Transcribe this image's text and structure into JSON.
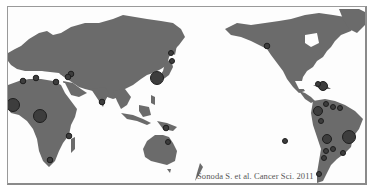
{
  "map": {
    "projection": "pacific-centered world map",
    "land_color": "#6b6b6b",
    "marker_color": "#3a3a3a",
    "marker_outline": "#1e1e1e",
    "background": "#ffffff",
    "markers": [
      {
        "region": "Morocco",
        "x": 40,
        "y": 76,
        "size": "small"
      },
      {
        "region": "Algeria",
        "x": 29,
        "y": 75,
        "size": "small"
      },
      {
        "region": "Tunisia/Libya",
        "x": 49,
        "y": 80,
        "size": "small"
      },
      {
        "region": "Middle East 1",
        "x": 64,
        "y": 72,
        "size": "small"
      },
      {
        "region": "Middle East 2",
        "x": 61,
        "y": 76,
        "size": "small"
      },
      {
        "region": "West Africa",
        "x": 12,
        "y": 104,
        "size": "large"
      },
      {
        "region": "Central Africa",
        "x": 39,
        "y": 115,
        "size": "large"
      },
      {
        "region": "East Africa",
        "x": 67,
        "y": 135,
        "size": "small"
      },
      {
        "region": "South Africa",
        "x": 49,
        "y": 159,
        "size": "small"
      },
      {
        "region": "India",
        "x": 101,
        "y": 101,
        "size": "small"
      },
      {
        "region": "Japan",
        "x": 156,
        "y": 77,
        "size": "large"
      },
      {
        "region": "Sakhalin/Hokkaido 1",
        "x": 170,
        "y": 52,
        "size": "small"
      },
      {
        "region": "Hokkaido 2",
        "x": 171,
        "y": 60,
        "size": "small"
      },
      {
        "region": "New Guinea",
        "x": 165,
        "y": 126,
        "size": "small"
      },
      {
        "region": "Australia N",
        "x": 167,
        "y": 141,
        "size": "small"
      },
      {
        "region": "Alaska/Canada West",
        "x": 266,
        "y": 45,
        "size": "small"
      },
      {
        "region": "Caribbean",
        "x": 321,
        "y": 85,
        "size": "medium"
      },
      {
        "region": "Caribbean small",
        "x": 315,
        "y": 83,
        "size": "small"
      },
      {
        "region": "Colombia",
        "x": 317,
        "y": 110,
        "size": "medium"
      },
      {
        "region": "Venezuela 1",
        "x": 325,
        "y": 103,
        "size": "small"
      },
      {
        "region": "Venezuela 2",
        "x": 332,
        "y": 106,
        "size": "small"
      },
      {
        "region": "Guyana",
        "x": 339,
        "y": 107,
        "size": "small"
      },
      {
        "region": "Ecuador",
        "x": 320,
        "y": 120,
        "size": "small"
      },
      {
        "region": "Peru/Bolivia",
        "x": 326,
        "y": 138,
        "size": "medium"
      },
      {
        "region": "Brazil",
        "x": 348,
        "y": 136,
        "size": "large"
      },
      {
        "region": "Bolivia S",
        "x": 325,
        "y": 150,
        "size": "small"
      },
      {
        "region": "Paraguay",
        "x": 332,
        "y": 148,
        "size": "small"
      },
      {
        "region": "Brazil S",
        "x": 342,
        "y": 152,
        "size": "small"
      },
      {
        "region": "Argentina N",
        "x": 323,
        "y": 157,
        "size": "small"
      },
      {
        "region": "Chile/Argentina",
        "x": 318,
        "y": 173,
        "size": "small"
      },
      {
        "region": "Pacific island",
        "x": 284,
        "y": 140,
        "size": "small"
      }
    ]
  },
  "citation": "Sonoda S. et al. Cancer Sci. 2011"
}
